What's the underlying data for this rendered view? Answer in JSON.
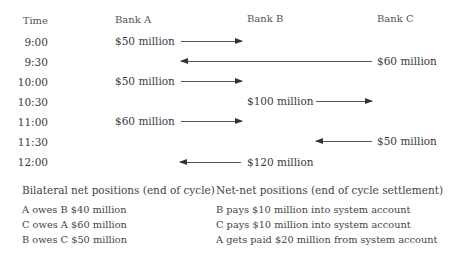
{
  "header": {
    "time": "Time",
    "bank_a": "Bank A",
    "bank_b": "Bank B",
    "bank_c": "Bank C"
  },
  "rows": [
    {
      "time": "9:00",
      "amount": "$50 million",
      "from": "Bank A",
      "to": "Bank B",
      "direction": "right"
    },
    {
      "time": "9:30",
      "amount": "$60 million",
      "from": "Bank C",
      "to": "Bank A",
      "direction": "left"
    },
    {
      "time": "10:00",
      "amount": "$50 million",
      "from": "Bank A",
      "to": "Bank B",
      "direction": "right"
    },
    {
      "time": "10:30",
      "amount": "$100 million",
      "from": "Bank B",
      "to": "Bank C",
      "direction": "right"
    },
    {
      "time": "11:00",
      "amount": "$60 million",
      "from": "Bank A",
      "to": "Bank B",
      "direction": "right"
    },
    {
      "time": "11:30",
      "amount": "$50 million",
      "from": "Bank C",
      "to": "Bank B",
      "direction": "left"
    },
    {
      "time": "12:00",
      "amount": "$120 million",
      "from": "Bank B",
      "to": "Bank A",
      "direction": "left"
    }
  ],
  "bilateral": {
    "title": "Bilateral net positions (end of cycle)",
    "items": [
      "A owes B $40 million",
      "C owes A $60 million",
      "B owes C $50 million"
    ]
  },
  "netnet": {
    "title": "Net-net positions (end of cycle settlement)",
    "items": [
      "B pays $10 million into system account",
      "C pays $10 million into system account",
      "A gets paid $20 million from system account"
    ]
  },
  "colors": {
    "text": "#3a3a3a",
    "arrow": "#555555",
    "background": "#ffffff"
  }
}
